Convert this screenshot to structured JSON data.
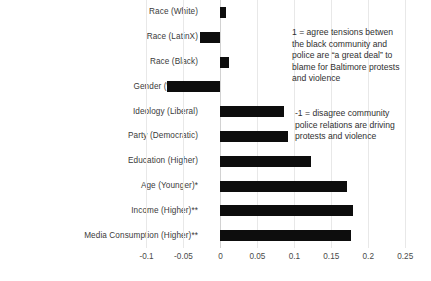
{
  "chart_data": {
    "type": "bar",
    "orientation": "horizontal",
    "title": "",
    "xlabel": "",
    "ylabel": "",
    "xlim": [
      -0.125,
      0.27
    ],
    "grid": true,
    "legend": "none",
    "xticks": [
      "-0.1",
      "-0.05",
      "0",
      "0.05",
      "0.1",
      "0.15",
      "0.2",
      "0.25"
    ],
    "xtick_values": [
      -0.1,
      -0.05,
      0,
      0.05,
      0.1,
      0.15,
      0.2,
      0.25
    ],
    "categories": [
      "Race (White)",
      "Race (LatinX)",
      "Race (Black)",
      "Gender (Women)",
      "Ideology (Liberal)",
      "Party (Democratic)",
      "Education (Higher)",
      "Age (Younger)*",
      "Income (Higher)**",
      "Media Consumption (Higher)**"
    ],
    "values": [
      0.008,
      -0.028,
      0.012,
      -0.072,
      0.086,
      0.092,
      0.123,
      0.171,
      0.179,
      0.176
    ],
    "bar_color": "#0d0d0d",
    "annotations": [
      "1 = agree tensions betwen the black community and police are “a great deal” to blame for Baltimore protests and violence",
      "-1 = disagree community police relations are driving protests and violence"
    ]
  },
  "annotations": {
    "agree": "1 = agree tensions betwen\nthe black community and\npolice are “a great deal” to\nblame for Baltimore protests\nand violence",
    "disagree": "-1 = disagree community\n police relations are driving\n protests and violence"
  }
}
